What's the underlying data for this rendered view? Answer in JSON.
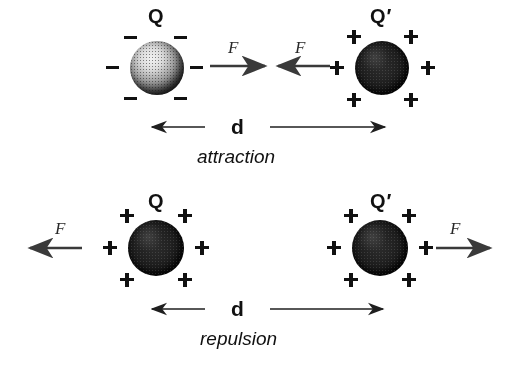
{
  "figure": {
    "background_color": "#ffffff",
    "ink_color": "#111111",
    "arrow_color": "#333333"
  },
  "panels": [
    {
      "id": "attraction",
      "caption": "attraction",
      "distance_label": "d",
      "left_charge": {
        "label": "Q",
        "prime": "",
        "polarity": "negative",
        "sign_glyph": "−",
        "sign_count": 6,
        "sphere_style": "light-speckled"
      },
      "right_charge": {
        "label": "Q",
        "prime": "′",
        "polarity": "positive",
        "sign_glyph": "+",
        "sign_count": 6,
        "sphere_style": "dark-grainy"
      },
      "forces": [
        {
          "label": "F",
          "direction": "right",
          "on": "left-charge"
        },
        {
          "label": "F",
          "direction": "left",
          "on": "right-charge"
        }
      ]
    },
    {
      "id": "repulsion",
      "caption": "repulsion",
      "distance_label": "d",
      "left_charge": {
        "label": "Q",
        "prime": "",
        "polarity": "positive",
        "sign_glyph": "+",
        "sign_count": 6,
        "sphere_style": "dark-grainy"
      },
      "right_charge": {
        "label": "Q",
        "prime": "′",
        "polarity": "positive",
        "sign_glyph": "+",
        "sign_count": 6,
        "sphere_style": "dark-grainy"
      },
      "forces": [
        {
          "label": "F",
          "direction": "left",
          "on": "left-charge"
        },
        {
          "label": "F",
          "direction": "right",
          "on": "right-charge"
        }
      ]
    }
  ]
}
